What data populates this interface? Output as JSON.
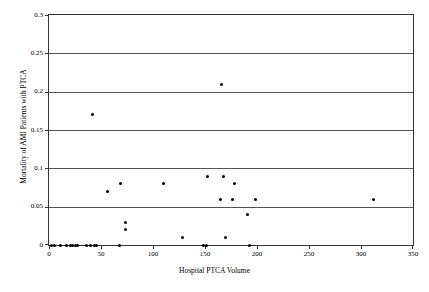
{
  "chart_data": {
    "type": "scatter",
    "title": "",
    "xlabel": "Hospital PTCA Volume",
    "ylabel": "Mortality of AMI Patients with PTCA",
    "xlim": [
      0,
      350
    ],
    "ylim": [
      0,
      0.3
    ],
    "xticks": [
      "0",
      "50",
      "100",
      "150",
      "200",
      "250",
      "300",
      "350"
    ],
    "xtick_values": [
      0,
      50,
      100,
      150,
      200,
      250,
      300,
      350
    ],
    "yticks": [
      "0",
      "0.05",
      "0.1",
      "0.15",
      "0.2",
      "0.25",
      "0.3"
    ],
    "ytick_values": [
      0,
      0.05,
      0.1,
      0.15,
      0.2,
      0.25,
      0.3
    ],
    "grid": "horizontal",
    "legend": "none",
    "marker": "filled-circle",
    "marker_color": "#000000",
    "points": [
      {
        "x": 2,
        "y": 0
      },
      {
        "x": 5,
        "y": 0
      },
      {
        "x": 11,
        "y": 0
      },
      {
        "x": 17,
        "y": 0
      },
      {
        "x": 21,
        "y": 0
      },
      {
        "x": 23,
        "y": 0
      },
      {
        "x": 25,
        "y": 0
      },
      {
        "x": 27,
        "y": 0
      },
      {
        "x": 36,
        "y": 0
      },
      {
        "x": 40,
        "y": 0
      },
      {
        "x": 42,
        "y": 0.17
      },
      {
        "x": 44,
        "y": 0
      },
      {
        "x": 46,
        "y": 0
      },
      {
        "x": 56,
        "y": 0.07
      },
      {
        "x": 68,
        "y": 0
      },
      {
        "x": 69,
        "y": 0.08
      },
      {
        "x": 74,
        "y": 0.03
      },
      {
        "x": 74,
        "y": 0.02
      },
      {
        "x": 110,
        "y": 0.08
      },
      {
        "x": 128,
        "y": 0.01
      },
      {
        "x": 149,
        "y": 0
      },
      {
        "x": 151,
        "y": 0
      },
      {
        "x": 152,
        "y": 0.09
      },
      {
        "x": 165,
        "y": 0.06
      },
      {
        "x": 166,
        "y": 0.21
      },
      {
        "x": 168,
        "y": 0.09
      },
      {
        "x": 170,
        "y": 0.01
      },
      {
        "x": 176,
        "y": 0.06
      },
      {
        "x": 178,
        "y": 0.08
      },
      {
        "x": 191,
        "y": 0.04
      },
      {
        "x": 193,
        "y": 0
      },
      {
        "x": 199,
        "y": 0.06
      },
      {
        "x": 312,
        "y": 0.06
      }
    ]
  }
}
